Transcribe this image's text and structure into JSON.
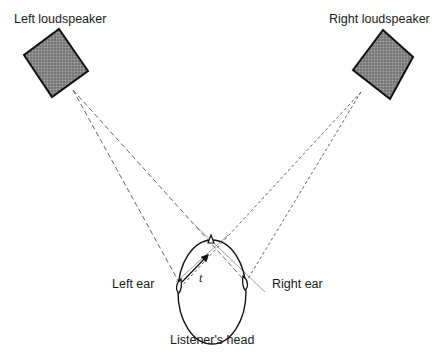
{
  "diagram": {
    "labels": {
      "left_speaker": "Left loudspeaker",
      "right_speaker": "Right loudspeaker",
      "left_ear": "Left ear",
      "right_ear": "Right ear",
      "head": "Listener's head",
      "t_symbol": "t"
    },
    "colors": {
      "speaker_fill": "#7a7a7a",
      "line": "#333333",
      "background": "#ffffff"
    }
  }
}
